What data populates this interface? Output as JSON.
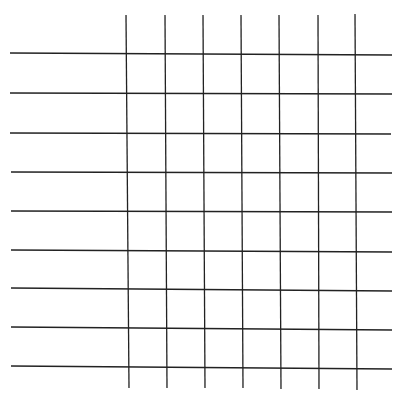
{
  "figure": {
    "width": 400,
    "height": 402,
    "background": "#ffffff",
    "line_color": "#222222",
    "line_width": 1.3
  },
  "grid": {
    "horizontal_lines": [
      {
        "y1": 53,
        "y2": 55,
        "x1": 10,
        "x2": 392
      },
      {
        "y1": 93,
        "y2": 94,
        "x1": 10,
        "x2": 392
      },
      {
        "y1": 133,
        "y2": 134,
        "x1": 10,
        "x2": 391
      },
      {
        "y1": 172,
        "y2": 173,
        "x1": 11,
        "x2": 392
      },
      {
        "y1": 211,
        "y2": 212,
        "x1": 11,
        "x2": 392
      },
      {
        "y1": 250,
        "y2": 252,
        "x1": 11,
        "x2": 392
      },
      {
        "y1": 288,
        "y2": 291,
        "x1": 11,
        "x2": 392
      },
      {
        "y1": 327,
        "y2": 330,
        "x1": 11,
        "x2": 392
      },
      {
        "y1": 366,
        "y2": 369,
        "x1": 11,
        "x2": 392
      }
    ],
    "vertical_lines": [
      {
        "x1": 126,
        "x2": 129,
        "y1": 15,
        "y2": 388
      },
      {
        "x1": 165,
        "x2": 167,
        "y1": 15,
        "y2": 388
      },
      {
        "x1": 203,
        "x2": 205,
        "y1": 15,
        "y2": 388
      },
      {
        "x1": 241,
        "x2": 243,
        "y1": 15,
        "y2": 388
      },
      {
        "x1": 279,
        "x2": 281,
        "y1": 15,
        "y2": 389
      },
      {
        "x1": 318,
        "x2": 319,
        "y1": 15,
        "y2": 389
      },
      {
        "x1": 355,
        "x2": 357,
        "y1": 14,
        "y2": 390
      }
    ],
    "rows": 9,
    "columns": 7
  }
}
